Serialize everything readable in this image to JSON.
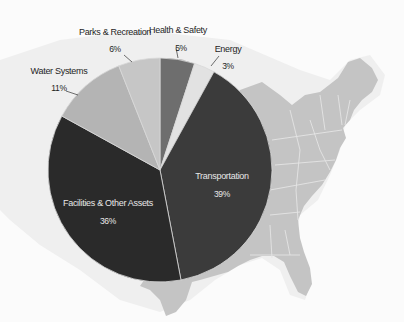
{
  "chart_data": {
    "type": "pie",
    "title": "",
    "start_angle_deg": 0,
    "direction": "clockwise",
    "slices": [
      {
        "label": "Health & Safety",
        "value": 5,
        "display": "5%",
        "color": "#6e6e6e"
      },
      {
        "label": "Energy",
        "value": 3,
        "display": "3%",
        "color": "#e2e2e2"
      },
      {
        "label": "Transportation",
        "value": 39,
        "display": "39%",
        "color": "#3b3b3b"
      },
      {
        "label": "Facilities & Other Assets",
        "value": 36,
        "display": "36%",
        "color": "#2a2a2a"
      },
      {
        "label": "Water Systems",
        "value": 11,
        "display": "11%",
        "color": "#b4b4b4"
      },
      {
        "label": "Parks & Recreation",
        "value": 6,
        "display": "6%",
        "color": "#c6c6c6"
      }
    ],
    "legend": "none",
    "background": "Map of the eastern United States in light gray"
  },
  "labels": {
    "health": {
      "name": "Health & Safety",
      "pct": "5%"
    },
    "energy": {
      "name": "Energy",
      "pct": "3%"
    },
    "transport": {
      "name": "Transportation",
      "pct": "39%"
    },
    "facilities": {
      "name": "Facilities & Other Assets",
      "pct": "36%"
    },
    "water": {
      "name": "Water Systems",
      "pct": "11%"
    },
    "parks": {
      "name": "Parks & Recreation",
      "pct": "6%"
    }
  }
}
